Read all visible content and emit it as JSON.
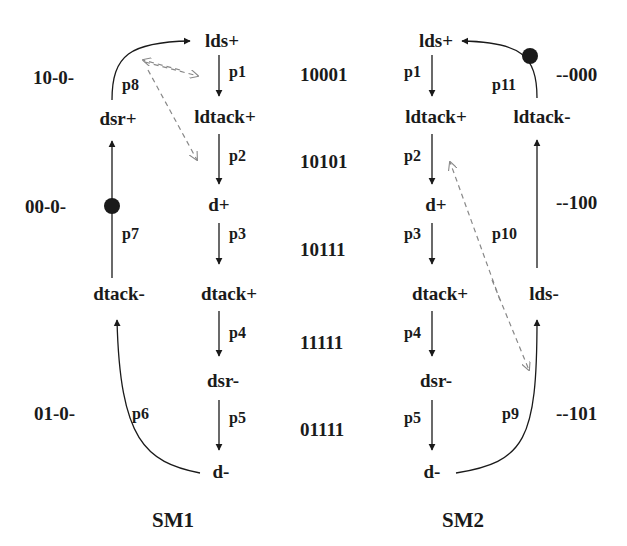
{
  "sm1": {
    "title": "SM1",
    "nodes": {
      "lds_plus": "lds+",
      "ldtack_plus": "ldtack+",
      "d_plus": "d+",
      "dtack_plus": "dtack+",
      "dsr_minus": "dsr-",
      "d_minus": "d-",
      "dtack_minus": "dtack-",
      "dsr_plus": "dsr+"
    },
    "places": {
      "p1": "p1",
      "p2": "p2",
      "p3": "p3",
      "p4": "p4",
      "p5": "p5",
      "p6": "p6",
      "p7": "p7",
      "p8": "p8"
    },
    "state_codes": [
      "10-0-",
      "00-0-",
      "01-0-"
    ],
    "token_place": "p7"
  },
  "center_codes": [
    "10001",
    "10101",
    "10111",
    "11111",
    "01111"
  ],
  "sm2": {
    "title": "SM2",
    "nodes": {
      "lds_plus": "lds+",
      "ldtack_plus": "ldtack+",
      "d_plus": "d+",
      "dtack_plus": "dtack+",
      "dsr_minus": "dsr-",
      "d_minus": "d-",
      "lds_minus": "lds-",
      "ldtack_minus": "ldtack-"
    },
    "places": {
      "p1": "p1",
      "p2": "p2",
      "p3": "p3",
      "p4": "p4",
      "p5": "p5",
      "p9": "p9",
      "p10": "p10",
      "p11": "p11"
    },
    "state_codes": [
      "--000",
      "--100",
      "--101"
    ],
    "token_place": "p11"
  },
  "colors": {
    "ink": "#1a1a1a",
    "dashed": "#888888",
    "background": "#ffffff"
  }
}
